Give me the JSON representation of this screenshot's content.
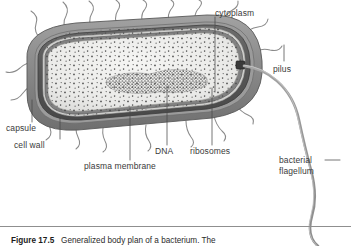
{
  "figure": {
    "number": "Figure 17.5",
    "caption_text": "Generalized body plan of a bacterium. The",
    "title": "Generalized body plan of a bacterium"
  },
  "labels": {
    "cytoplasm": "cytoplasm",
    "pilus": "pilus",
    "capsule": "capsule",
    "cell_wall": "cell wall",
    "plasma_membrane": "plasma membrane",
    "dna": "DNA",
    "ribosomes": "ribosomes",
    "bacterial_flagellum_line1": "bacterial",
    "bacterial_flagellum_line2": "flagellum"
  },
  "colors": {
    "capsule": "#8d8d8d",
    "cell_wall": "#5d5d5d",
    "periplasm": "#c9c9c9",
    "plasma_membrane": "#7a7a7a",
    "cytoplasm": "#e9e9e7",
    "nucleoid": "#6b6b6b",
    "ribosome_dot": "#4a4a4a",
    "flagellum": "#9a9a9a",
    "pilus": "#8a8a8a",
    "leader_line": "#4a4a4a",
    "label_text": "#3a3a3a",
    "background": "#ffffff"
  },
  "structures": {
    "cell_shape": "rod-shaped bacillus",
    "envelope_layers": [
      "capsule",
      "cell wall",
      "plasma membrane"
    ],
    "appendages": [
      "pili",
      "bacterial flagellum"
    ],
    "interior_contents": [
      "cytoplasm",
      "DNA nucleoid",
      "ribosomes"
    ]
  }
}
